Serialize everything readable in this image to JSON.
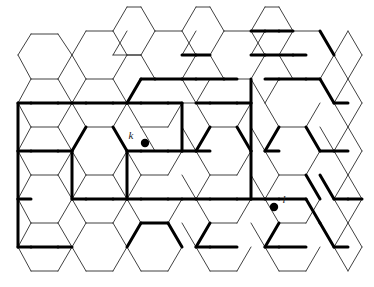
{
  "figure": {
    "type": "hexagonal-lattice-diagram",
    "title": "",
    "background_color": "#ffffff",
    "width": 374,
    "height": 287
  },
  "style": {
    "thin_edge_color": "#2b2b2b",
    "thin_edge_width": 0.9,
    "bold_edge_color": "#000000",
    "bold_edge_width": 3.0,
    "vertex_color": "#000000",
    "label_color": "#1a1a1a"
  },
  "lattice": {
    "orientation": "flat-top",
    "hex_width": 55,
    "hex_height": 48,
    "column_step_x": 41.5,
    "row_step_y": 48,
    "column_offset_y": 24,
    "origin_x": 18,
    "origin_y": 34,
    "columns": 9,
    "rows": 6
  },
  "marked_vertices": [
    {
      "id": "k",
      "label": "k",
      "x": 145,
      "y": 143,
      "label_x": 131,
      "label_y": 139,
      "radius": 4.2
    },
    {
      "id": "l",
      "label": "l",
      "x": 274,
      "y": 207,
      "label_x": 284,
      "label_y": 203,
      "radius": 4.2
    }
  ],
  "thin_edges": [
    [
      18,
      55,
      31,
      34
    ],
    [
      31,
      34,
      58,
      34
    ],
    [
      58,
      34,
      72,
      55
    ],
    [
      72,
      55,
      58,
      79
    ],
    [
      58,
      79,
      31,
      79
    ],
    [
      31,
      79,
      18,
      55
    ],
    [
      18,
      103,
      31,
      79
    ],
    [
      72,
      103,
      58,
      79
    ],
    [
      18,
      103,
      31,
      127
    ],
    [
      31,
      127,
      58,
      127
    ],
    [
      58,
      127,
      72,
      103
    ],
    [
      18,
      151,
      31,
      127
    ],
    [
      72,
      151,
      58,
      127
    ],
    [
      18,
      151,
      31,
      175
    ],
    [
      31,
      175,
      58,
      175
    ],
    [
      58,
      175,
      72,
      151
    ],
    [
      18,
      199,
      31,
      175
    ],
    [
      72,
      199,
      58,
      175
    ],
    [
      18,
      199,
      31,
      223
    ],
    [
      31,
      223,
      58,
      223
    ],
    [
      58,
      223,
      72,
      199
    ],
    [
      18,
      247,
      31,
      223
    ],
    [
      72,
      247,
      58,
      223
    ],
    [
      18,
      247,
      31,
      271
    ],
    [
      31,
      271,
      58,
      271
    ],
    [
      58,
      271,
      72,
      247
    ],
    [
      72,
      55,
      86,
      31
    ],
    [
      86,
      31,
      113,
      31
    ],
    [
      113,
      31,
      127,
      55
    ],
    [
      127,
      55,
      113,
      79
    ],
    [
      113,
      79,
      86,
      79
    ],
    [
      86,
      79,
      72,
      55
    ],
    [
      72,
      103,
      86,
      79
    ],
    [
      127,
      103,
      113,
      79
    ],
    [
      72,
      103,
      86,
      127
    ],
    [
      86,
      127,
      113,
      127
    ],
    [
      113,
      127,
      127,
      103
    ],
    [
      72,
      151,
      86,
      127
    ],
    [
      127,
      151,
      113,
      127
    ],
    [
      72,
      151,
      86,
      175
    ],
    [
      86,
      175,
      113,
      175
    ],
    [
      113,
      175,
      127,
      151
    ],
    [
      72,
      199,
      86,
      175
    ],
    [
      127,
      199,
      113,
      175
    ],
    [
      72,
      199,
      86,
      223
    ],
    [
      86,
      223,
      113,
      223
    ],
    [
      113,
      223,
      127,
      199
    ],
    [
      72,
      247,
      86,
      223
    ],
    [
      127,
      247,
      113,
      223
    ],
    [
      72,
      247,
      86,
      271
    ],
    [
      86,
      271,
      113,
      271
    ],
    [
      113,
      271,
      127,
      247
    ],
    [
      127,
      7,
      141,
      7
    ],
    [
      127,
      7,
      113,
      31
    ],
    [
      141,
      7,
      155,
      31
    ],
    [
      155,
      31,
      141,
      55
    ],
    [
      141,
      55,
      113,
      55
    ],
    [
      113,
      55,
      127,
      31
    ],
    [
      127,
      55,
      141,
      55
    ],
    [
      155,
      31,
      182,
      31
    ],
    [
      182,
      31,
      196,
      55
    ],
    [
      196,
      55,
      182,
      79
    ],
    [
      182,
      79,
      155,
      79
    ],
    [
      155,
      79,
      141,
      55
    ],
    [
      127,
      103,
      141,
      79
    ],
    [
      196,
      103,
      182,
      79
    ],
    [
      127,
      103,
      141,
      127
    ],
    [
      141,
      127,
      168,
      127
    ],
    [
      168,
      127,
      182,
      103
    ],
    [
      182,
      103,
      196,
      103
    ],
    [
      141,
      127,
      155,
      151
    ],
    [
      196,
      151,
      182,
      127
    ],
    [
      127,
      151,
      141,
      175
    ],
    [
      141,
      175,
      168,
      175
    ],
    [
      168,
      175,
      182,
      151
    ],
    [
      127,
      199,
      141,
      175
    ],
    [
      196,
      199,
      182,
      175
    ],
    [
      127,
      199,
      141,
      223
    ],
    [
      141,
      223,
      168,
      223
    ],
    [
      168,
      223,
      182,
      199
    ],
    [
      127,
      247,
      141,
      223
    ],
    [
      196,
      247,
      182,
      223
    ],
    [
      141,
      271,
      168,
      271
    ],
    [
      168,
      271,
      182,
      247
    ],
    [
      127,
      247,
      141,
      271
    ],
    [
      196,
      7,
      210,
      7
    ],
    [
      196,
      7,
      182,
      31
    ],
    [
      210,
      7,
      224,
      31
    ],
    [
      224,
      31,
      210,
      55
    ],
    [
      210,
      55,
      182,
      55
    ],
    [
      182,
      55,
      196,
      31
    ],
    [
      224,
      31,
      251,
      31
    ],
    [
      251,
      31,
      265,
      55
    ],
    [
      265,
      55,
      251,
      79
    ],
    [
      251,
      79,
      224,
      79
    ],
    [
      224,
      79,
      210,
      55
    ],
    [
      196,
      103,
      210,
      79
    ],
    [
      265,
      103,
      251,
      79
    ],
    [
      196,
      103,
      210,
      127
    ],
    [
      210,
      127,
      237,
      127
    ],
    [
      237,
      127,
      251,
      103
    ],
    [
      265,
      151,
      251,
      127
    ],
    [
      196,
      151,
      210,
      175
    ],
    [
      210,
      175,
      237,
      175
    ],
    [
      237,
      175,
      251,
      151
    ],
    [
      196,
      199,
      210,
      175
    ],
    [
      265,
      199,
      251,
      175
    ],
    [
      196,
      199,
      210,
      223
    ],
    [
      210,
      223,
      237,
      223
    ],
    [
      237,
      223,
      251,
      199
    ],
    [
      196,
      247,
      210,
      223
    ],
    [
      265,
      247,
      251,
      223
    ],
    [
      210,
      271,
      237,
      271
    ],
    [
      237,
      271,
      251,
      247
    ],
    [
      196,
      247,
      210,
      271
    ],
    [
      265,
      7,
      279,
      7
    ],
    [
      265,
      7,
      251,
      31
    ],
    [
      279,
      7,
      293,
      31
    ],
    [
      293,
      31,
      279,
      55
    ],
    [
      279,
      55,
      251,
      55
    ],
    [
      251,
      55,
      265,
      31
    ],
    [
      293,
      31,
      320,
      31
    ],
    [
      320,
      31,
      334,
      55
    ],
    [
      334,
      55,
      320,
      79
    ],
    [
      320,
      79,
      293,
      79
    ],
    [
      293,
      79,
      279,
      55
    ],
    [
      265,
      103,
      279,
      79
    ],
    [
      334,
      103,
      320,
      79
    ],
    [
      265,
      103,
      279,
      127
    ],
    [
      279,
      127,
      306,
      127
    ],
    [
      306,
      127,
      320,
      103
    ],
    [
      334,
      151,
      320,
      127
    ],
    [
      265,
      151,
      279,
      175
    ],
    [
      279,
      175,
      306,
      175
    ],
    [
      306,
      175,
      320,
      151
    ],
    [
      265,
      199,
      279,
      175
    ],
    [
      334,
      199,
      320,
      175
    ],
    [
      265,
      199,
      279,
      223
    ],
    [
      279,
      223,
      306,
      223
    ],
    [
      306,
      223,
      320,
      199
    ],
    [
      265,
      247,
      279,
      223
    ],
    [
      334,
      247,
      320,
      223
    ],
    [
      279,
      271,
      306,
      271
    ],
    [
      306,
      271,
      320,
      247
    ],
    [
      265,
      247,
      279,
      271
    ],
    [
      334,
      55,
      348,
      31
    ],
    [
      348,
      31,
      362,
      55
    ],
    [
      362,
      55,
      348,
      79
    ],
    [
      348,
      79,
      334,
      55
    ],
    [
      334,
      103,
      348,
      79
    ],
    [
      362,
      103,
      348,
      79
    ],
    [
      334,
      103,
      348,
      127
    ],
    [
      348,
      127,
      362,
      103
    ],
    [
      334,
      151,
      348,
      127
    ],
    [
      362,
      151,
      348,
      127
    ],
    [
      334,
      151,
      348,
      175
    ],
    [
      348,
      175,
      362,
      151
    ],
    [
      334,
      199,
      348,
      175
    ],
    [
      362,
      199,
      348,
      175
    ],
    [
      334,
      199,
      348,
      223
    ],
    [
      348,
      223,
      362,
      199
    ],
    [
      334,
      247,
      348,
      223
    ],
    [
      362,
      247,
      348,
      223
    ],
    [
      334,
      247,
      348,
      271
    ],
    [
      348,
      271,
      362,
      247
    ]
  ],
  "bold_edges": [
    [
      18,
      103,
      31,
      103
    ],
    [
      31,
      103,
      58,
      103
    ],
    [
      58,
      103,
      72,
      103
    ],
    [
      18,
      151,
      31,
      151
    ],
    [
      31,
      151,
      58,
      151
    ],
    [
      58,
      151,
      72,
      151
    ],
    [
      18,
      199,
      31,
      199
    ],
    [
      18,
      199,
      18,
      151
    ],
    [
      18,
      247,
      31,
      247
    ],
    [
      31,
      247,
      58,
      247
    ],
    [
      58,
      247,
      72,
      247
    ],
    [
      18,
      247,
      18,
      199
    ],
    [
      18,
      103,
      18,
      151
    ],
    [
      72,
      103,
      86,
      103
    ],
    [
      86,
      103,
      113,
      103
    ],
    [
      113,
      103,
      127,
      103
    ],
    [
      86,
      127,
      72,
      151
    ],
    [
      113,
      127,
      127,
      151
    ],
    [
      72,
      199,
      86,
      199
    ],
    [
      86,
      199,
      113,
      199
    ],
    [
      113,
      199,
      127,
      199
    ],
    [
      127,
      151,
      141,
      151
    ],
    [
      141,
      151,
      168,
      151
    ],
    [
      168,
      151,
      182,
      151
    ],
    [
      72,
      151,
      72,
      199
    ],
    [
      127,
      103,
      141,
      103
    ],
    [
      141,
      103,
      168,
      103
    ],
    [
      168,
      103,
      182,
      103
    ],
    [
      141,
      79,
      127,
      103
    ],
    [
      141,
      79,
      155,
      79
    ],
    [
      155,
      79,
      182,
      79
    ],
    [
      127,
      151,
      127,
      199
    ],
    [
      141,
      223,
      127,
      247
    ],
    [
      141,
      223,
      168,
      223
    ],
    [
      168,
      223,
      182,
      247
    ],
    [
      127,
      199,
      141,
      199
    ],
    [
      141,
      199,
      168,
      199
    ],
    [
      168,
      199,
      182,
      199
    ],
    [
      182,
      55,
      196,
      55
    ],
    [
      196,
      55,
      210,
      55
    ],
    [
      182,
      79,
      196,
      79
    ],
    [
      196,
      79,
      224,
      79
    ],
    [
      224,
      79,
      237,
      79
    ],
    [
      196,
      103,
      210,
      103
    ],
    [
      210,
      103,
      237,
      103
    ],
    [
      237,
      103,
      251,
      103
    ],
    [
      182,
      103,
      182,
      151
    ],
    [
      210,
      127,
      196,
      151
    ],
    [
      237,
      127,
      251,
      151
    ],
    [
      182,
      151,
      196,
      151
    ],
    [
      196,
      151,
      210,
      151
    ],
    [
      182,
      199,
      196,
      199
    ],
    [
      196,
      199,
      210,
      199
    ],
    [
      210,
      199,
      237,
      199
    ],
    [
      237,
      199,
      251,
      199
    ],
    [
      210,
      223,
      196,
      247
    ],
    [
      196,
      247,
      210,
      247
    ],
    [
      210,
      247,
      237,
      247
    ],
    [
      251,
      31,
      265,
      31
    ],
    [
      265,
      31,
      279,
      31
    ],
    [
      279,
      31,
      293,
      31
    ],
    [
      251,
      55,
      265,
      55
    ],
    [
      265,
      55,
      293,
      55
    ],
    [
      293,
      55,
      306,
      55
    ],
    [
      265,
      79,
      279,
      79
    ],
    [
      279,
      79,
      306,
      79
    ],
    [
      306,
      79,
      320,
      79
    ],
    [
      251,
      79,
      251,
      103
    ],
    [
      279,
      127,
      265,
      151
    ],
    [
      251,
      103,
      251,
      151
    ],
    [
      306,
      127,
      320,
      151
    ],
    [
      265,
      151,
      279,
      151
    ],
    [
      251,
      199,
      265,
      199
    ],
    [
      265,
      199,
      279,
      199
    ],
    [
      279,
      199,
      306,
      199
    ],
    [
      279,
      223,
      265,
      247
    ],
    [
      265,
      247,
      279,
      247
    ],
    [
      279,
      247,
      306,
      247
    ],
    [
      251,
      151,
      251,
      199
    ],
    [
      320,
      31,
      334,
      55
    ],
    [
      320,
      79,
      334,
      103
    ],
    [
      334,
      103,
      348,
      103
    ],
    [
      320,
      151,
      334,
      151
    ],
    [
      334,
      151,
      348,
      151
    ],
    [
      320,
      175,
      334,
      199
    ],
    [
      334,
      199,
      348,
      199
    ],
    [
      348,
      199,
      362,
      199
    ],
    [
      320,
      223,
      334,
      247
    ],
    [
      334,
      247,
      348,
      247
    ],
    [
      306,
      175,
      320,
      199
    ],
    [
      306,
      199,
      320,
      223
    ]
  ],
  "legend": {
    "note": "bold edges mark an occupied cluster; dots mark sites k and l"
  }
}
